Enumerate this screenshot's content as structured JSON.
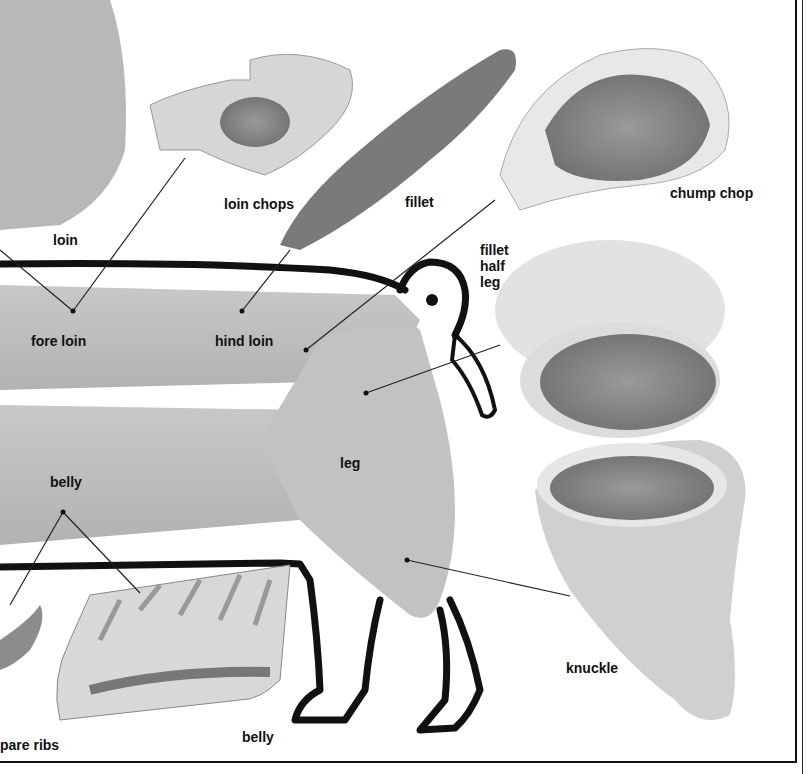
{
  "diagram": {
    "labels": {
      "loin": "loin",
      "loin_chops": "loin chops",
      "fillet": "fillet",
      "chump_chop": "chump chop",
      "fillet_half_leg": [
        "fillet",
        "half",
        "leg"
      ],
      "fore_loin": "fore loin",
      "hind_loin": "hind loin",
      "leg": "leg",
      "belly_body": "belly",
      "belly_cut": "belly",
      "spare_ribs": "pare ribs",
      "knuckle": "knuckle"
    },
    "colors": {
      "outline": "#111111",
      "meat_gray": "#8a8a8a",
      "fat_light": "#e6e6e6",
      "body_gray": "#bdbdbd"
    }
  }
}
